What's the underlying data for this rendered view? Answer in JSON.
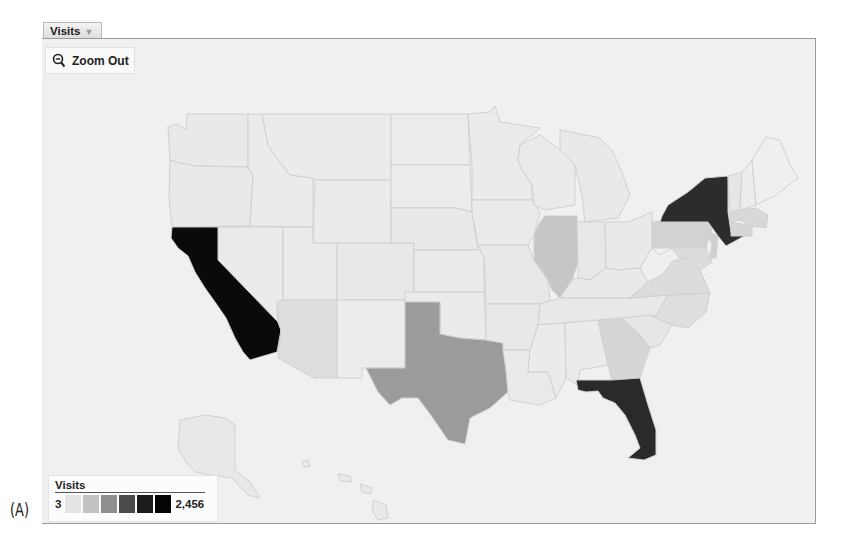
{
  "figure_label": "(A)",
  "metric_tab": {
    "label": "Visits",
    "caret": "▼"
  },
  "zoom_button": {
    "label": "Zoom Out",
    "icon": "magnifier-minus-icon"
  },
  "legend": {
    "title": "Visits",
    "min": "3",
    "max": "2,456",
    "swatches": [
      "#e4e4e4",
      "#c2c2c2",
      "#8e8e8e",
      "#4a4a4a",
      "#1c1c1c",
      "#050505"
    ]
  },
  "colors": {
    "background": "#f0f0f0",
    "state_border": "#d2d2d2",
    "frame_border": "#9a9a9a"
  },
  "map": {
    "region": "United States",
    "shading_metric": "Visits",
    "states": [
      {
        "name": "California",
        "shade": "#0a0a0a",
        "level": "highest"
      },
      {
        "name": "New York",
        "shade": "#2c2c2c",
        "level": "very high"
      },
      {
        "name": "Florida",
        "shade": "#2a2a2a",
        "level": "very high"
      },
      {
        "name": "Texas",
        "shade": "#9b9b9b",
        "level": "medium"
      },
      {
        "name": "Illinois",
        "shade": "#c6c6c6",
        "level": "low-medium"
      },
      {
        "name": "Pennsylvania",
        "shade": "#d2d2d2",
        "level": "low-medium"
      },
      {
        "name": "New Jersey",
        "shade": "#cfcfcf",
        "level": "low-medium"
      },
      {
        "name": "Georgia",
        "shade": "#d6d6d6",
        "level": "low"
      },
      {
        "name": "Arizona",
        "shade": "#dedede",
        "level": "low"
      },
      {
        "name": "Massachusetts",
        "shade": "#d8d8d8",
        "level": "low"
      },
      {
        "name": "Connecticut",
        "shade": "#d6d6d6",
        "level": "low"
      },
      {
        "name": "Virginia",
        "shade": "#dcdcdc",
        "level": "low"
      },
      {
        "name": "North Carolina",
        "shade": "#dedede",
        "level": "low"
      },
      {
        "name": "Other states",
        "shade": "#e8e8e8",
        "level": "lowest"
      }
    ]
  }
}
